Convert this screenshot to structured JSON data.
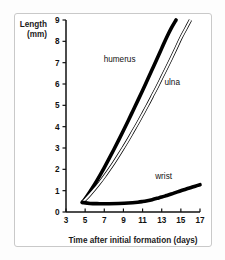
{
  "chart_data": {
    "type": "line",
    "title": "",
    "xlabel": "Time after initial formation (days)",
    "ylabel": "Length (mm)",
    "ylabel_line1": "Length",
    "ylabel_line2": "(mm)",
    "xlim": [
      3,
      17
    ],
    "ylim": [
      0,
      9
    ],
    "grid": false,
    "legend_position": "inline-annotations",
    "xticks": [
      3,
      5,
      7,
      9,
      11,
      13,
      15,
      17
    ],
    "xtick_labels": [
      "3",
      "5",
      "7",
      "9",
      "11",
      "13",
      "15",
      "17"
    ],
    "yticks": [
      0,
      1,
      2,
      3,
      4,
      5,
      6,
      7,
      8,
      9
    ],
    "ytick_labels": [
      "0",
      "1",
      "2",
      "3",
      "4",
      "5",
      "6",
      "7",
      "8",
      "9"
    ],
    "series": [
      {
        "name": "humerus",
        "label": "humerus",
        "style": "thick-solid-black",
        "color": "#000000",
        "label_x": 8.6,
        "label_y": 7.05,
        "x": [
          4.7,
          5.0,
          5.5,
          6.0,
          6.5,
          7.0,
          7.5,
          8.0,
          8.5,
          9.0,
          9.5,
          10.0,
          10.5,
          11.0,
          11.5,
          12.0,
          12.5,
          13.0,
          13.5,
          14.0,
          14.5
        ],
        "y": [
          0.45,
          0.62,
          0.95,
          1.3,
          1.68,
          2.08,
          2.5,
          2.93,
          3.37,
          3.82,
          4.28,
          4.75,
          5.22,
          5.7,
          6.19,
          6.68,
          7.17,
          7.67,
          8.17,
          8.62,
          9.0
        ]
      },
      {
        "name": "ulna",
        "label": "ulna",
        "style": "thin-hollow-outline",
        "color": "#000000",
        "label_x": 14.1,
        "label_y": 5.95,
        "x": [
          4.7,
          5.0,
          5.5,
          6.0,
          6.5,
          7.0,
          7.5,
          8.0,
          8.5,
          9.0,
          9.5,
          10.0,
          10.5,
          11.0,
          11.5,
          12.0,
          12.5,
          13.0,
          13.5,
          14.0,
          14.5,
          15.0,
          15.5,
          16.0
        ],
        "y": [
          0.45,
          0.58,
          0.82,
          1.08,
          1.36,
          1.66,
          1.98,
          2.31,
          2.66,
          3.02,
          3.39,
          3.78,
          4.17,
          4.58,
          4.99,
          5.42,
          5.85,
          6.3,
          6.75,
          7.21,
          7.68,
          8.16,
          8.58,
          9.0
        ]
      },
      {
        "name": "wrist",
        "label": "wrist",
        "style": "thick-solid-black",
        "color": "#000000",
        "label_x": 13.2,
        "label_y": 1.55,
        "x": [
          4.7,
          5.5,
          6.5,
          7.5,
          8.5,
          9.5,
          10.5,
          11.0,
          11.5,
          12.0,
          12.5,
          13.0,
          13.5,
          14.0,
          14.5,
          15.0,
          15.5,
          16.0,
          16.5,
          17.0
        ],
        "y": [
          0.45,
          0.4,
          0.39,
          0.39,
          0.4,
          0.42,
          0.46,
          0.49,
          0.53,
          0.58,
          0.64,
          0.7,
          0.77,
          0.84,
          0.92,
          1.0,
          1.07,
          1.14,
          1.21,
          1.28
        ]
      }
    ]
  },
  "colors": {
    "frame_border": "#c9c9c9",
    "axis": "#111111",
    "text": "#111111",
    "background": "#ffffff",
    "page_background": "#fdfdfd"
  }
}
